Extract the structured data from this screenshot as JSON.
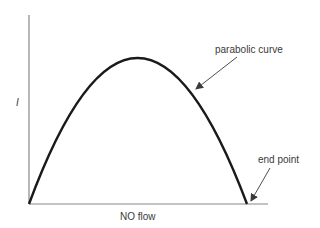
{
  "diagram": {
    "y_axis_label": "I",
    "x_axis_label": "NO flow",
    "annotations": [
      {
        "text": "parabolic curve",
        "target": "curve"
      },
      {
        "text": "end point",
        "target": "curve end on x-axis"
      }
    ],
    "curve": {
      "type": "parabola",
      "start": [
        29,
        204
      ],
      "peak": [
        137,
        58
      ],
      "end": [
        247,
        204
      ]
    },
    "colors": {
      "axis": "#888888",
      "curve": "#1a1a1a",
      "text": "#3a3a3a",
      "arrow": "#3a3a3a"
    }
  }
}
